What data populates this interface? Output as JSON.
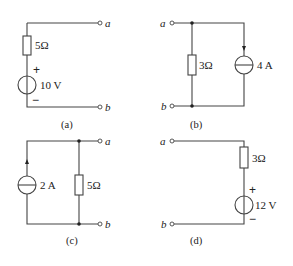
{
  "circuits": {
    "a": {
      "caption": "(a)",
      "resistor": "5Ω",
      "source": "10 V",
      "plus": "+",
      "minus": "−",
      "term_top": "a",
      "term_bottom": "b"
    },
    "b": {
      "caption": "(b)",
      "resistor": "3Ω",
      "source": "4 A",
      "term_top": "a",
      "term_bottom": "b"
    },
    "c": {
      "caption": "(c)",
      "resistor": "5Ω",
      "source": "2 A",
      "term_top": "a",
      "term_bottom": "b"
    },
    "d": {
      "caption": "(d)",
      "resistor": "3Ω",
      "source": "12 V",
      "plus": "+",
      "minus": "−",
      "term_top": "a",
      "term_bottom": "b"
    }
  }
}
